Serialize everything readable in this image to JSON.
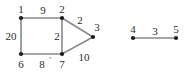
{
  "figure": {
    "title": "",
    "background_color": "#ffffff",
    "edge_color": "#8a8a8a",
    "vertex_color": "#1a1a1a",
    "label_color": "#2b2b2b"
  },
  "chart_data": {
    "type": "diagram",
    "subtype": "weighted-undirected-graph",
    "title": "",
    "xlabel": "",
    "ylabel": "",
    "components": 2,
    "nodes": [
      {
        "id": "1",
        "label": "1",
        "x": 21,
        "y": 18,
        "label_dx": 0,
        "label_dy": -5
      },
      {
        "id": "2",
        "label": "2",
        "x": 62,
        "y": 18,
        "label_dx": 0,
        "label_dy": -5
      },
      {
        "id": "3",
        "label": "3",
        "x": 93,
        "y": 37,
        "label_dx": 4,
        "label_dy": -6
      },
      {
        "id": "6",
        "label": "6",
        "x": 21,
        "y": 54,
        "label_dx": 0,
        "label_dy": 14
      },
      {
        "id": "7",
        "label": "7",
        "x": 62,
        "y": 54,
        "label_dx": 0,
        "label_dy": 14
      },
      {
        "id": "4",
        "label": "4",
        "x": 133,
        "y": 38,
        "label_dx": 0,
        "label_dy": -5
      },
      {
        "id": "5",
        "label": "5",
        "x": 176,
        "y": 38,
        "label_dx": 0,
        "label_dy": -5
      }
    ],
    "edges": [
      {
        "source": "1",
        "target": "2",
        "weight": "9",
        "label_x": 43,
        "label_y": 14
      },
      {
        "source": "1",
        "target": "6",
        "weight": "20",
        "label_x": 11,
        "label_y": 40
      },
      {
        "source": "6",
        "target": "7",
        "weight": "8",
        "label_x": 42,
        "label_y": 68
      },
      {
        "source": "2",
        "target": "7",
        "weight": "2",
        "label_x": 57,
        "label_y": 40
      },
      {
        "source": "2",
        "target": "3",
        "weight": "2",
        "label_x": 80,
        "label_y": 24
      },
      {
        "source": "7",
        "target": "3",
        "weight": "10",
        "label_x": 84,
        "label_y": 61
      },
      {
        "source": "4",
        "target": "5",
        "weight": "3",
        "label_x": 155,
        "label_y": 35
      }
    ],
    "marks": [
      {
        "id": "prime-after-8",
        "glyph": "'",
        "x": 50,
        "y": 63
      }
    ]
  }
}
